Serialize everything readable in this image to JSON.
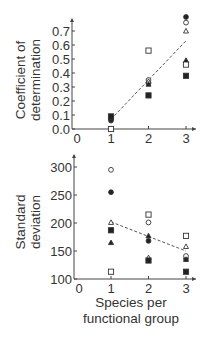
{
  "chart_data": [
    {
      "type": "scatter",
      "title": "",
      "xlabel": "",
      "ylabel": "Coefficient of determination",
      "ylabel_lines": [
        "Coefficient of",
        "determination"
      ],
      "xlim": [
        0,
        3.2
      ],
      "ylim": [
        0,
        0.75
      ],
      "x_ticks": [
        "0",
        "1",
        "2",
        "3"
      ],
      "y_ticks": [
        "0.0",
        "0.1",
        "0.2",
        "0.3",
        "0.4",
        "0.5",
        "0.6",
        "0.7"
      ],
      "grid": false,
      "legend": null,
      "series": [
        {
          "name": "filled circle",
          "marker": "circle-filled",
          "points": [
            [
              1,
              0.06
            ],
            [
              2,
              0.33
            ],
            [
              3,
              0.8
            ]
          ]
        },
        {
          "name": "open circle",
          "marker": "circle-open",
          "points": [
            [
              1,
              0.0
            ],
            [
              2,
              0.35
            ],
            [
              3,
              0.76
            ]
          ]
        },
        {
          "name": "open triangle",
          "marker": "triangle-open",
          "points": [
            [
              1,
              0.08
            ],
            [
              2,
              0.34
            ],
            [
              3,
              0.7
            ]
          ]
        },
        {
          "name": "filled triangle",
          "marker": "triangle-filled",
          "points": [
            [
              1,
              0.08
            ],
            [
              2,
              0.32
            ],
            [
              3,
              0.49
            ]
          ]
        },
        {
          "name": "open square",
          "marker": "square-open",
          "points": [
            [
              1,
              0.0
            ],
            [
              2,
              0.56
            ],
            [
              3,
              0.46
            ]
          ]
        },
        {
          "name": "filled square",
          "marker": "square-filled",
          "points": [
            [
              1,
              0.09
            ],
            [
              2,
              0.24
            ],
            [
              3,
              0.38
            ]
          ]
        }
      ],
      "trendline": {
        "style": "dashed",
        "from": [
          1,
          0.07
        ],
        "to": [
          3,
          0.63
        ]
      }
    },
    {
      "type": "scatter",
      "title": "",
      "xlabel": "Species per functional group",
      "xlabel_lines": [
        "Species per",
        "functional group"
      ],
      "ylabel": "Standard deviation",
      "ylabel_lines": [
        "Standard",
        "deviation"
      ],
      "xlim": [
        0,
        3.2
      ],
      "ylim": [
        100,
        300
      ],
      "x_ticks": [
        "0",
        "1",
        "2",
        "3"
      ],
      "y_ticks": [
        "100",
        "150",
        "200",
        "250",
        "300"
      ],
      "grid": false,
      "legend": null,
      "series": [
        {
          "name": "filled circle",
          "marker": "circle-filled",
          "points": [
            [
              1,
              255
            ],
            [
              2,
              168
            ],
            [
              3,
              136
            ]
          ]
        },
        {
          "name": "open circle",
          "marker": "circle-open",
          "points": [
            [
              1,
              295
            ],
            [
              2,
              201
            ],
            [
              3,
              141
            ]
          ]
        },
        {
          "name": "open triangle",
          "marker": "triangle-open",
          "points": [
            [
              1,
              201
            ],
            [
              2,
              138
            ],
            [
              3,
              158
            ]
          ]
        },
        {
          "name": "filled triangle",
          "marker": "triangle-filled",
          "points": [
            [
              1,
              165
            ],
            [
              2,
              177
            ],
            [
              3,
              135
            ]
          ]
        },
        {
          "name": "open square",
          "marker": "square-open",
          "points": [
            [
              1,
              113
            ],
            [
              2,
              215
            ],
            [
              3,
              177
            ]
          ]
        },
        {
          "name": "filled square",
          "marker": "square-filled",
          "points": [
            [
              1,
              187
            ],
            [
              2,
              133
            ],
            [
              3,
              113
            ]
          ]
        }
      ],
      "trendline": {
        "style": "dashed",
        "from": [
          1,
          202
        ],
        "to": [
          3,
          150
        ]
      }
    }
  ]
}
